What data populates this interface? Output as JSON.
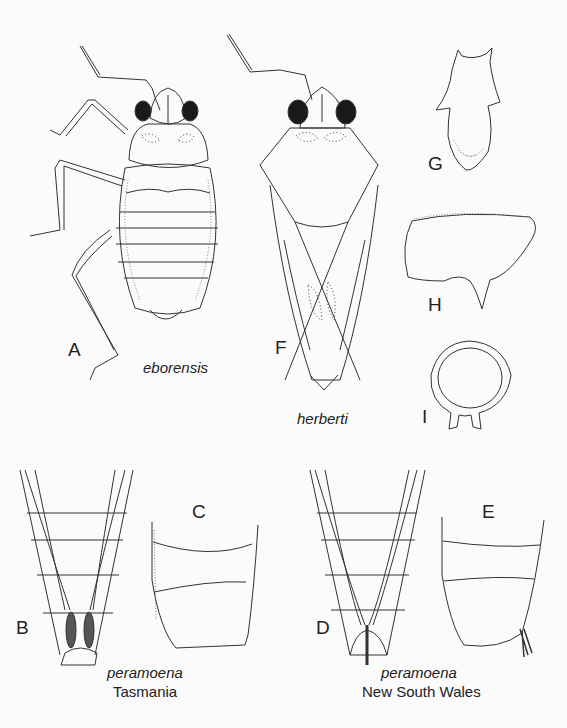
{
  "figure": {
    "panels": [
      {
        "id": "A",
        "label": "A",
        "description": "nymph dorsal habitus"
      },
      {
        "id": "F",
        "label": "F",
        "description": "adult dorsal habitus"
      },
      {
        "id": "G",
        "label": "G",
        "description": "pronotum/scutellum detail"
      },
      {
        "id": "H",
        "label": "H",
        "description": "lateral plate detail"
      },
      {
        "id": "I",
        "label": "I",
        "description": "ring-shaped structure detail"
      },
      {
        "id": "B",
        "label": "B",
        "description": "abdomen apex ventral"
      },
      {
        "id": "C",
        "label": "C",
        "description": "abdomen segments lateral"
      },
      {
        "id": "D",
        "label": "D",
        "description": "abdomen apex ventral"
      },
      {
        "id": "E",
        "label": "E",
        "description": "abdomen segments lateral"
      }
    ],
    "captions": {
      "eborensis": "eborensis",
      "herberti": "herberti",
      "tas_species": "peramoena",
      "tas_locality": "Tasmania",
      "nsw_species": "peramoena",
      "nsw_locality": "New South Wales"
    },
    "colors": {
      "ink": "#333333",
      "eye": "#1a1a1a",
      "background": "#fbfbfb"
    }
  }
}
